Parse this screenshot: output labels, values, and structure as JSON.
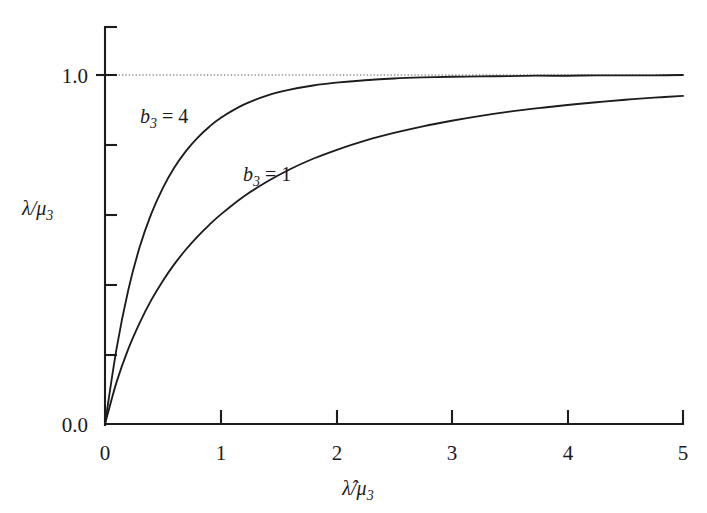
{
  "figure": {
    "background_color": "#ffffff",
    "ink_color": "#1c1c1c"
  },
  "chart_data": {
    "type": "line",
    "title": "",
    "subtitle": "",
    "xlabel": "λ̂/μ₃",
    "ylabel": "λ/μ₃",
    "xlim": [
      0,
      5
    ],
    "ylim": [
      0,
      1.2
    ],
    "grid": false,
    "legend_position": "inline-annotations",
    "x_ticks": [
      0,
      1,
      2,
      3,
      4,
      5
    ],
    "x_tick_labels": [
      "0",
      "1",
      "2",
      "3",
      "4",
      "5"
    ],
    "y_ticks": [
      0.0,
      0.2,
      0.4,
      0.6,
      0.8,
      1.0,
      1.2
    ],
    "y_tick_labels": [
      "0.0",
      "",
      "",
      "",
      "",
      "1.0",
      ""
    ],
    "annotations": [
      {
        "text": "b₃ = 4",
        "base": "b",
        "subscript": "3",
        "equals": "= 4",
        "x": 0.62,
        "y": 0.885
      },
      {
        "text": "b₃ = 1",
        "base": "b",
        "subscript": "3",
        "equals": "= 1",
        "x": 1.42,
        "y": 0.66
      }
    ],
    "reference_lines": [
      {
        "name": "asymptote",
        "orientation": "horizontal",
        "y": 1.0,
        "style": "dotted"
      }
    ],
    "x": [
      0,
      0.1,
      0.2,
      0.3,
      0.4,
      0.5,
      0.6,
      0.7,
      0.8,
      0.9,
      1.0,
      1.2,
      1.4,
      1.6,
      1.8,
      2.0,
      2.25,
      2.5,
      2.75,
      3.0,
      3.25,
      3.5,
      3.75,
      4.0,
      4.25,
      4.5,
      4.75,
      5.0
    ],
    "series": [
      {
        "name": "b₃ = 4",
        "values": [
          0.0,
          0.216,
          0.382,
          0.507,
          0.602,
          0.676,
          0.735,
          0.782,
          0.82,
          0.851,
          0.877,
          0.915,
          0.941,
          0.958,
          0.97,
          0.978,
          0.985,
          0.99,
          0.993,
          0.995,
          0.996,
          0.997,
          0.998,
          0.998,
          0.999,
          0.999,
          0.999,
          1.0
        ]
      },
      {
        "name": "b₃ = 1",
        "values": [
          0.0,
          0.12,
          0.214,
          0.29,
          0.355,
          0.41,
          0.458,
          0.5,
          0.537,
          0.57,
          0.6,
          0.652,
          0.694,
          0.73,
          0.76,
          0.785,
          0.812,
          0.834,
          0.853,
          0.869,
          0.883,
          0.895,
          0.905,
          0.914,
          0.922,
          0.929,
          0.935,
          0.94
        ]
      }
    ]
  },
  "axes": {
    "y_top_label": "1.0",
    "y_bottom_label": "0.0",
    "x_labels": [
      "0",
      "1",
      "2",
      "3",
      "4",
      "5"
    ],
    "y_title_base": "λ/μ",
    "y_title_sub": "3",
    "x_title_base": "λ̂/μ",
    "x_title_sub": "3"
  }
}
